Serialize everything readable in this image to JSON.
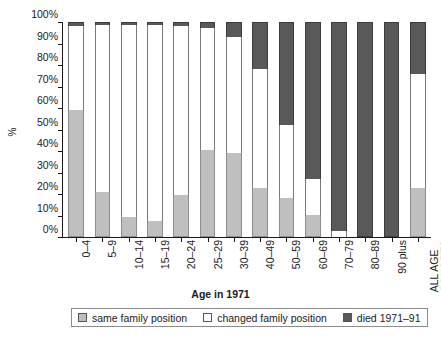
{
  "axes": {
    "y_label": "%",
    "y_ticks": [
      "0%",
      "10%",
      "20%",
      "30%",
      "40%",
      "50%",
      "60%",
      "70%",
      "80%",
      "90%",
      "100%"
    ],
    "x_title": "Age in 1971"
  },
  "legend": {
    "items": [
      {
        "label": "same family position",
        "swatch": "same-family-swatch",
        "color": "#bfbfbf"
      },
      {
        "label": "changed family position",
        "swatch": "changed-family-swatch",
        "color": "#ffffff"
      },
      {
        "label": "died 1971–91",
        "swatch": "died-swatch",
        "color": "#595959"
      }
    ]
  },
  "chart_data": {
    "type": "bar",
    "subtype": "stacked-100-percent",
    "title": "",
    "xlabel": "Age in 1971",
    "ylabel": "%",
    "ylim": [
      0,
      100
    ],
    "ytick_interval": 10,
    "grid": false,
    "legend_position": "bottom",
    "categories": [
      "0–4",
      "5–9",
      "10–14",
      "15–19",
      "20–24",
      "25–29",
      "30–39",
      "40–49",
      "50–59",
      "60–69",
      "70–79",
      "80–89",
      "90 plus",
      "ALL AGE COHORTS"
    ],
    "series": [
      {
        "name": "same family position",
        "color": "#bfbfbf",
        "values": [
          59,
          21,
          9.5,
          7.5,
          19.5,
          40.5,
          39,
          23,
          18,
          10,
          0,
          0,
          0,
          23
        ]
      },
      {
        "name": "changed family position",
        "color": "#ffffff",
        "values": [
          39,
          77.5,
          89,
          91,
          78.5,
          56.5,
          54,
          55,
          34,
          17,
          3,
          0,
          0,
          53
        ]
      },
      {
        "name": "died 1971–91",
        "color": "#595959",
        "values": [
          2,
          1.5,
          1.5,
          1.5,
          2,
          3,
          7,
          22,
          48,
          73,
          97,
          100,
          100,
          24
        ]
      }
    ]
  }
}
